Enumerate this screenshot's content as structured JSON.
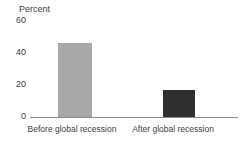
{
  "chart_data": {
    "type": "bar",
    "categories": [
      "Before global recession",
      "After global recession"
    ],
    "values": [
      46,
      17
    ],
    "bar_colors": [
      "#a8a8a8",
      "#2f2f2f"
    ],
    "title": "",
    "xlabel": "",
    "ylabel": "Percent",
    "yticks": [
      "60",
      "40",
      "20",
      "0"
    ],
    "ylim": [
      0,
      60
    ],
    "grid": false,
    "legend": "none"
  },
  "colors": {
    "background": "#ffffff",
    "axis_line": "#8c8c8c",
    "text": "#3d3d3d",
    "bar_before": "#a8a8a8",
    "bar_after": "#2f2f2f"
  }
}
